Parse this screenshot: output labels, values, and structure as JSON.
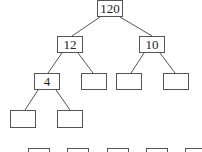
{
  "diagram": {
    "type": "binary-tree",
    "colors": {
      "stroke": "#555555",
      "text": "#222222",
      "background": "#ffffff"
    },
    "nodes": [
      {
        "id": "n120",
        "label": "120",
        "x": 97,
        "y": 0,
        "w": 26,
        "h": 17
      },
      {
        "id": "n12",
        "label": "12",
        "x": 57,
        "y": 36,
        "w": 26,
        "h": 17
      },
      {
        "id": "n10",
        "label": "10",
        "x": 139,
        "y": 36,
        "w": 26,
        "h": 17
      },
      {
        "id": "n4",
        "label": "4",
        "x": 34,
        "y": 73,
        "w": 26,
        "h": 17
      },
      {
        "id": "e1",
        "label": "",
        "x": 81,
        "y": 73,
        "w": 26,
        "h": 17
      },
      {
        "id": "e2",
        "label": "",
        "x": 116,
        "y": 73,
        "w": 26,
        "h": 17
      },
      {
        "id": "e3",
        "label": "",
        "x": 163,
        "y": 73,
        "w": 26,
        "h": 17
      },
      {
        "id": "e4",
        "label": "",
        "x": 10,
        "y": 110,
        "w": 26,
        "h": 18
      },
      {
        "id": "e5",
        "label": "",
        "x": 57,
        "y": 110,
        "w": 26,
        "h": 18
      },
      {
        "id": "b1",
        "label": "",
        "x": 28,
        "y": 148,
        "w": 22,
        "h": 10
      },
      {
        "id": "b2",
        "label": "",
        "x": 67,
        "y": 148,
        "w": 22,
        "h": 10
      },
      {
        "id": "b3",
        "label": "",
        "x": 107,
        "y": 148,
        "w": 22,
        "h": 10
      },
      {
        "id": "b4",
        "label": "",
        "x": 146,
        "y": 148,
        "w": 22,
        "h": 10
      },
      {
        "id": "b5",
        "label": "",
        "x": 185,
        "y": 148,
        "w": 22,
        "h": 10
      }
    ],
    "edges": [
      {
        "from": "n120",
        "to": "n12",
        "x1": 100,
        "y1": 17,
        "x2": 72,
        "y2": 36
      },
      {
        "from": "n120",
        "to": "n10",
        "x1": 120,
        "y1": 17,
        "x2": 152,
        "y2": 36
      },
      {
        "from": "n12",
        "to": "n4",
        "x1": 62,
        "y1": 53,
        "x2": 48,
        "y2": 73
      },
      {
        "from": "n12",
        "to": "e1",
        "x1": 78,
        "y1": 53,
        "x2": 93,
        "y2": 73
      },
      {
        "from": "n10",
        "to": "e2",
        "x1": 144,
        "y1": 53,
        "x2": 131,
        "y2": 73
      },
      {
        "from": "n10",
        "to": "e3",
        "x1": 160,
        "y1": 53,
        "x2": 175,
        "y2": 73
      },
      {
        "from": "n4",
        "to": "e4",
        "x1": 38,
        "y1": 90,
        "x2": 25,
        "y2": 110
      },
      {
        "from": "n4",
        "to": "e5",
        "x1": 56,
        "y1": 90,
        "x2": 70,
        "y2": 110
      }
    ]
  }
}
